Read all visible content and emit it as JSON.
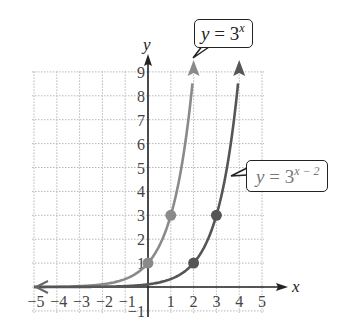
{
  "chart_data": {
    "type": "line",
    "title": "",
    "xlabel": "x",
    "ylabel": "y",
    "xlim": [
      -5,
      5
    ],
    "ylim": [
      -1,
      9
    ],
    "grid": true,
    "grid_style": "dotted",
    "x_ticks": [
      "-5",
      "-4",
      "-3",
      "-2",
      "-1",
      "1",
      "2",
      "3",
      "4",
      "5"
    ],
    "y_ticks": [
      "-1",
      "1",
      "2",
      "3",
      "4",
      "5",
      "6",
      "7",
      "8",
      "9"
    ],
    "series": [
      {
        "name": "y = 3^x",
        "function": "3^x",
        "color": "#8a8a8a",
        "labeled_points": [
          [
            0,
            1
          ],
          [
            1,
            3
          ]
        ],
        "x_range": [
          -5,
          2
        ],
        "points": [
          [
            -5,
            0.004
          ],
          [
            -4,
            0.012
          ],
          [
            -3,
            0.037
          ],
          [
            -2,
            0.111
          ],
          [
            -1,
            0.333
          ],
          [
            0,
            1
          ],
          [
            1,
            3
          ],
          [
            2,
            9
          ]
        ]
      },
      {
        "name": "y = 3^(x - 2)",
        "function": "3^(x-2)",
        "color": "#555555",
        "labeled_points": [
          [
            2,
            1
          ],
          [
            3,
            3
          ]
        ],
        "x_range": [
          -5,
          4
        ],
        "points": [
          [
            -5,
            0.0005
          ],
          [
            -3,
            0.004
          ],
          [
            -1,
            0.037
          ],
          [
            0,
            0.111
          ],
          [
            1,
            0.333
          ],
          [
            2,
            1
          ],
          [
            3,
            3
          ],
          [
            4,
            9
          ]
        ]
      }
    ],
    "annotations": [
      {
        "text": "y = 3^x",
        "points_to": "series 0 top"
      },
      {
        "text": "y = 3^(x − 2)",
        "points_to": "series 1 near y=4.5"
      }
    ]
  },
  "labels": {
    "x_axis": "x",
    "y_axis": "y",
    "callout1": {
      "y": "y",
      "eq": " = 3",
      "exp": "x"
    },
    "callout2": {
      "y": "y",
      "eq": " = 3",
      "exp": "x − 2"
    }
  }
}
